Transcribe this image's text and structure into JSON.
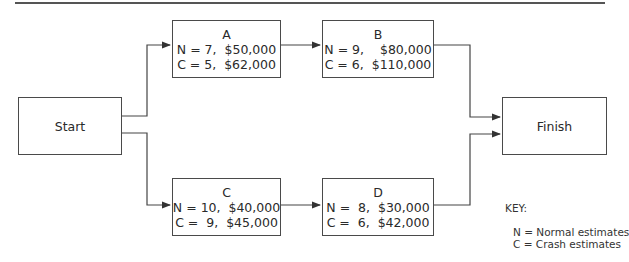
{
  "diagram": {
    "type": "network-diagram",
    "start": {
      "label": "Start"
    },
    "finish": {
      "label": "Finish"
    },
    "activities": [
      {
        "id": "A",
        "label": "A",
        "normal": "N = 7,  $50,000",
        "crash": "C = 5,  $62,000"
      },
      {
        "id": "B",
        "label": "B",
        "normal": "N = 9,    $80,000",
        "crash": "C = 6,  $110,000"
      },
      {
        "id": "C",
        "label": "C",
        "normal": "N = 10,  $40,000",
        "crash": "C =  9,  $45,000"
      },
      {
        "id": "D",
        "label": "D",
        "normal": "N =  8,  $30,000",
        "crash": "C =  6,  $42,000"
      }
    ],
    "edges": [
      {
        "from": "Start",
        "to": "A"
      },
      {
        "from": "A",
        "to": "B"
      },
      {
        "from": "B",
        "to": "Finish"
      },
      {
        "from": "Start",
        "to": "C"
      },
      {
        "from": "C",
        "to": "D"
      },
      {
        "from": "D",
        "to": "Finish"
      }
    ],
    "key": {
      "title": "KEY:",
      "normal": "N = Normal estimates",
      "crash": "C = Crash estimates"
    }
  }
}
